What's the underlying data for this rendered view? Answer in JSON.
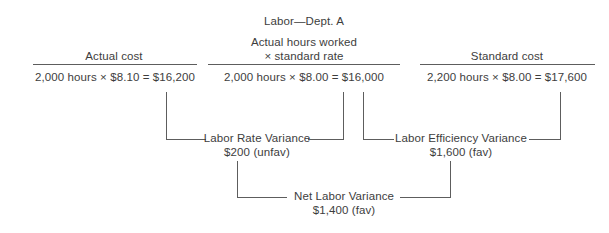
{
  "diagram": {
    "title": "Labor—Dept. A",
    "columns": [
      {
        "header": "Actual cost",
        "formula": "2,000 hours × $8.10 = $16,200"
      },
      {
        "header_line1": "Actual hours worked",
        "header_line2": "× standard rate",
        "formula": "2,000 hours × $8.00 = $16,000"
      },
      {
        "header": "Standard cost",
        "formula": "2,200 hours × $8.00 = $17,600"
      }
    ],
    "variances": [
      {
        "label": "Labor Rate Variance",
        "amount": "$200 (unfav)"
      },
      {
        "label": "Labor Efficiency Variance",
        "amount": "$1,600 (fav)"
      },
      {
        "label": "Net Labor Variance",
        "amount": "$1,400 (fav)"
      }
    ],
    "line_color": "#5d5d5d",
    "text_color": "#3d3d3d"
  }
}
